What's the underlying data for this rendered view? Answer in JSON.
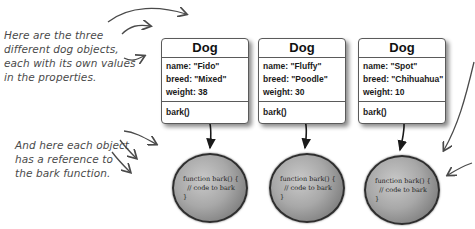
{
  "annotations": {
    "objects_note": [
      "Here are the three",
      "different dog objects,",
      "each with its own values",
      "in the properties."
    ],
    "function_note": [
      "And here each object",
      "has a reference to",
      "the bark function."
    ]
  },
  "dogs": [
    {
      "class_name": "Dog",
      "props": [
        "name: \"Fido\"",
        "breed: \"Mixed\"",
        "weight: 38"
      ],
      "method": "bark()"
    },
    {
      "class_name": "Dog",
      "props": [
        "name: \"Fluffy\"",
        "breed: \"Poodle\"",
        "weight: 30"
      ],
      "method": "bark()"
    },
    {
      "class_name": "Dog",
      "props": [
        "name: \"Spot\"",
        "breed: \"Chihuahua\"",
        "weight: 10"
      ],
      "method": "bark()"
    }
  ],
  "functions": [
    {
      "line1": "function bark() {",
      "line2": "  // code to bark",
      "line3": "}"
    },
    {
      "line1": "function bark() {",
      "line2": "  // code to bark",
      "line3": "}"
    },
    {
      "line1": "function bark() {",
      "line2": "  // code to bark",
      "line3": "}"
    }
  ],
  "colors": {
    "ink": "#4a4a4a",
    "box_border": "#5a5a5a",
    "ball_border": "#2e2e2e"
  }
}
